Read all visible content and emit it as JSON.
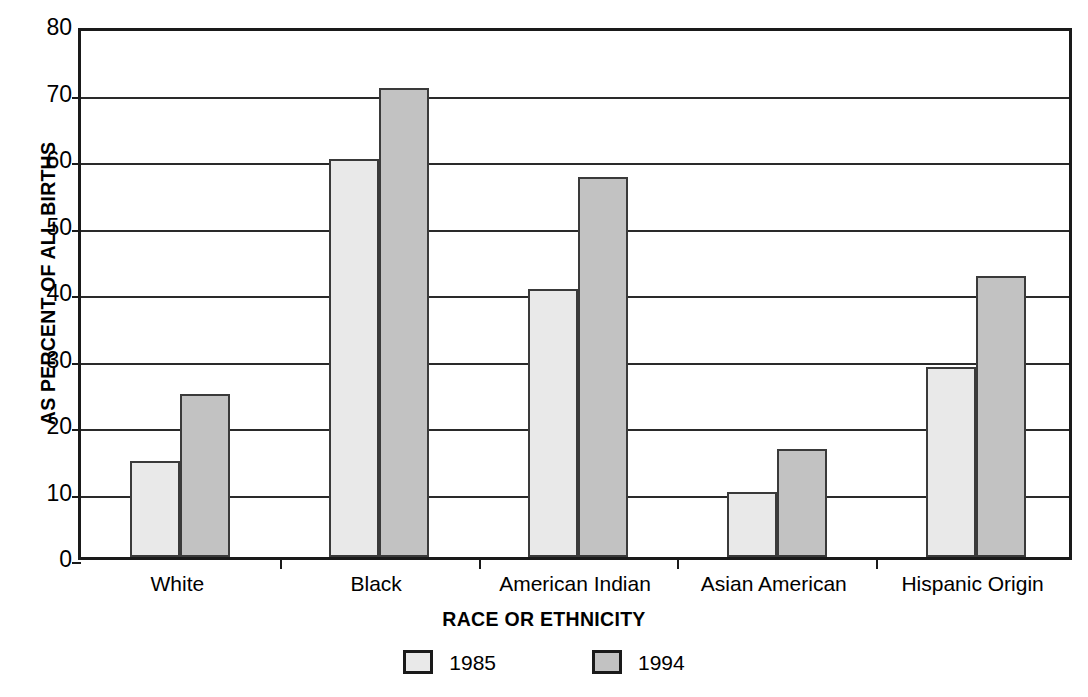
{
  "chart_data": {
    "type": "bar",
    "title": "",
    "xlabel": "RACE OR ETHNICITY",
    "ylabel": "AS PERCENT OF ALL BIRTHS",
    "categories": [
      "White",
      "Black",
      "American Indian",
      "Asian American",
      "Hispanic Origin"
    ],
    "series": [
      {
        "name": "1985",
        "color": "#e9e9e9",
        "values": [
          14.5,
          59.8,
          40.3,
          9.8,
          28.6
        ]
      },
      {
        "name": "1994",
        "color": "#c2c2c2",
        "values": [
          24.5,
          70.6,
          57.2,
          16.3,
          42.3
        ]
      }
    ],
    "ylim": [
      0,
      80
    ],
    "ytick_values": [
      0,
      10,
      20,
      30,
      40,
      50,
      60,
      70,
      80
    ],
    "ytick_labels": [
      "0",
      "10",
      "20",
      "30",
      "40",
      "50",
      "60",
      "70",
      "80"
    ],
    "grid": "horizontal",
    "legend_position": "bottom-center",
    "legend_entries": [
      "1985",
      "1994"
    ],
    "bar_border_color": "#3a3a3a",
    "axis_color": "#1a1a1a"
  }
}
